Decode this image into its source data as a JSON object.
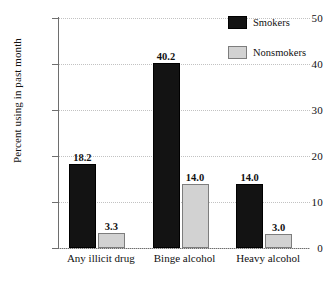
{
  "chart_data": {
    "type": "bar",
    "title": "",
    "xlabel": "",
    "ylabel": "Percent using in past month",
    "ylim": [
      0,
      50
    ],
    "yticks": [
      0,
      10,
      20,
      30,
      40,
      50
    ],
    "ytick_labels": [
      "0",
      "10",
      "20",
      "30",
      "40",
      "50"
    ],
    "grid": true,
    "grid_axis": "y",
    "grid_style": "dotted",
    "legend_position": "top-right",
    "categories": [
      "Any illicit drug",
      "Binge alcohol",
      "Heavy alcohol"
    ],
    "series": [
      {
        "name": "Smokers",
        "color": "#131313",
        "values": [
          18.2,
          40.2,
          14.0
        ],
        "labels": [
          "18.2",
          "40.2",
          "14.0"
        ]
      },
      {
        "name": "Nonsmokers",
        "color": "#d2d2d2",
        "values": [
          3.3,
          14.0,
          3.0
        ],
        "labels": [
          "3.3",
          "14.0",
          "3.0"
        ]
      }
    ]
  },
  "legend": {
    "items": [
      {
        "label": "Smokers",
        "swatch": "smokers-swatch"
      },
      {
        "label": "Nonsmokers",
        "swatch": "nonsmokers-swatch"
      }
    ]
  }
}
